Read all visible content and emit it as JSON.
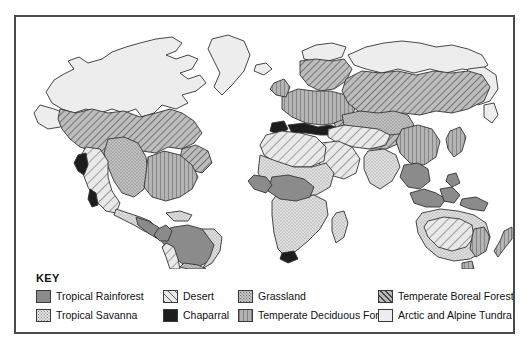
{
  "figure": {
    "type": "thematic-world-map"
  },
  "legend": {
    "title": "KEY",
    "items": [
      {
        "id": "tropical-rainforest",
        "label": "Tropical Rainforest",
        "swatch": "rainforest",
        "color": "#8b8b8b",
        "pattern": "solid-medium-gray",
        "column": 1,
        "row": 1
      },
      {
        "id": "tropical-savanna",
        "label": "Tropical Savanna",
        "swatch": "savanna",
        "color": "#e2e2e2",
        "pattern": "fine-stipple-light",
        "column": 1,
        "row": 2
      },
      {
        "id": "desert",
        "label": "Desert",
        "swatch": "desert",
        "color": "#e8e8e8",
        "pattern": "wide-diagonal-hatch",
        "column": 2,
        "row": 1
      },
      {
        "id": "chaparral",
        "label": "Chaparral",
        "swatch": "chaparral",
        "color": "#1d1d1d",
        "pattern": "solid-black",
        "column": 2,
        "row": 2
      },
      {
        "id": "grassland",
        "label": "Grassland",
        "swatch": "grassland",
        "color": "#c4c4c4",
        "pattern": "stipple-gray",
        "column": 3,
        "row": 1
      },
      {
        "id": "temperate-deciduous-forest",
        "label": "Temperate Deciduous Forest",
        "swatch": "deciduous",
        "color": "#b2b2b2",
        "pattern": "vertical-lines",
        "column": 3,
        "row": 2
      },
      {
        "id": "temperate-boreal-forest",
        "label": "Temperate Boreal Forest",
        "swatch": "boreal",
        "color": "#b8b8b8",
        "pattern": "dense-diagonal-hatch",
        "column": 4,
        "row": 1
      },
      {
        "id": "arctic-alpine-tundra",
        "label": "Arctic and Alpine Tundra",
        "swatch": "tundra",
        "color": "#ededed",
        "pattern": "solid-very-light",
        "column": 4,
        "row": 2
      }
    ]
  },
  "map": {
    "ocean_color": "#ffffff",
    "outline_color": "#333333",
    "frame_color": "#4a4a4a",
    "landmasses": [
      {
        "name": "North America",
        "biomes": [
          "arctic-alpine-tundra",
          "temperate-boreal-forest",
          "grassland",
          "temperate-deciduous-forest",
          "desert",
          "chaparral",
          "tropical-savanna"
        ]
      },
      {
        "name": "Greenland",
        "biomes": [
          "arctic-alpine-tundra"
        ]
      },
      {
        "name": "Central America",
        "biomes": [
          "tropical-rainforest",
          "tropical-savanna"
        ]
      },
      {
        "name": "South America",
        "biomes": [
          "tropical-rainforest",
          "tropical-savanna",
          "grassland",
          "desert"
        ]
      },
      {
        "name": "Europe",
        "biomes": [
          "temperate-deciduous-forest",
          "temperate-boreal-forest",
          "arctic-alpine-tundra",
          "chaparral"
        ]
      },
      {
        "name": "Africa",
        "biomes": [
          "desert",
          "tropical-savanna",
          "tropical-rainforest",
          "chaparral"
        ]
      },
      {
        "name": "Asia",
        "biomes": [
          "arctic-alpine-tundra",
          "temperate-boreal-forest",
          "grassland",
          "desert",
          "temperate-deciduous-forest",
          "tropical-rainforest",
          "tropical-savanna"
        ]
      },
      {
        "name": "Southeast Asia Islands",
        "biomes": [
          "tropical-rainforest"
        ]
      },
      {
        "name": "Australia",
        "biomes": [
          "desert",
          "tropical-savanna",
          "grassland",
          "temperate-deciduous-forest"
        ]
      },
      {
        "name": "New Zealand",
        "biomes": [
          "temperate-deciduous-forest"
        ]
      }
    ]
  }
}
